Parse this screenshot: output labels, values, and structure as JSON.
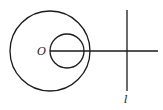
{
  "diagram": {
    "stroke_color": "#1a1a1a",
    "background": "#ffffff",
    "outer_circle": {
      "cx": 50,
      "cy": 51,
      "r": 40
    },
    "inner_circle": {
      "cx": 67,
      "cy": 51,
      "r": 17
    },
    "ray": {
      "x1": 50,
      "y1": 51,
      "x2": 158,
      "y2": 51
    },
    "line_l": {
      "x1": 127,
      "y1": 10,
      "x2": 127,
      "y2": 91
    },
    "labels": {
      "center": "O",
      "line": "l"
    }
  }
}
